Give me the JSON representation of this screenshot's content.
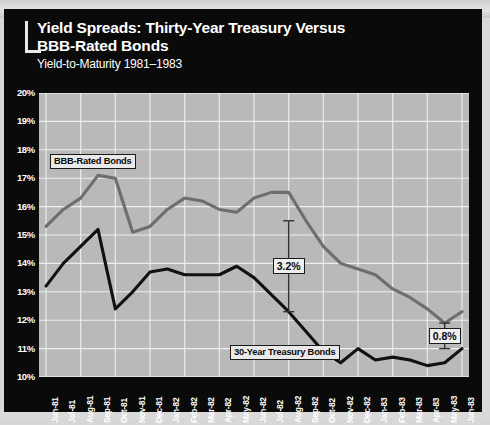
{
  "panel": {
    "background_color": "#0a0a0a",
    "plot_background_color": "#b9b9b9"
  },
  "header": {
    "title": "Yield Spreads: Thirty-Year Treasury Versus\nBBB-Rated Bonds",
    "subtitle": "Yield-to-Maturity 1981–1983"
  },
  "annotations": {
    "bbb_callout": "BBB-Rated Bonds",
    "treasury_callout": "30-Year Treasury Bonds",
    "spread_1": "3.2%",
    "spread_2": "0.8%"
  },
  "chart_data": {
    "type": "line",
    "title": "Yield Spreads: Thirty-Year Treasury Versus BBB-Rated Bonds",
    "subtitle": "Yield-to-Maturity 1981–1983",
    "xlabel": "",
    "ylabel": "",
    "ylim": [
      10,
      20
    ],
    "ytick_labels": [
      "20%",
      "19%",
      "18%",
      "17%",
      "16%",
      "15%",
      "14%",
      "13%",
      "12%",
      "11%",
      "10%"
    ],
    "ytick_values": [
      20,
      19,
      18,
      17,
      16,
      15,
      14,
      13,
      12,
      11,
      10
    ],
    "grid": true,
    "legend": "inline-callouts",
    "categories": [
      "Jun-81",
      "Jul-81",
      "Aug-81",
      "Sep-81",
      "Oct-81",
      "Nov-81",
      "Dec-81",
      "Jan-82",
      "Feb-82",
      "Mar-82",
      "Apr-82",
      "May-82",
      "Jun-82",
      "Jul-82",
      "Aug-82",
      "Sep-82",
      "Oct-82",
      "Nov-82",
      "Dec-82",
      "Jan-83",
      "Feb-83",
      "Mar-83",
      "Apr-83",
      "May-83",
      "Jun-83"
    ],
    "series": [
      {
        "name": "BBB-Rated Bonds",
        "color": "#6e6e6e",
        "values": [
          15.3,
          15.9,
          16.3,
          17.1,
          17.0,
          15.1,
          15.3,
          15.9,
          16.3,
          16.2,
          15.9,
          15.8,
          16.3,
          16.5,
          16.5,
          15.5,
          14.6,
          14.0,
          13.8,
          13.6,
          13.1,
          12.8,
          12.4,
          11.9,
          12.3
        ]
      },
      {
        "name": "30-Year Treasury Bonds",
        "color": "#111111",
        "values": [
          13.2,
          14.0,
          14.6,
          15.2,
          12.4,
          13.0,
          13.7,
          13.8,
          13.6,
          13.6,
          13.6,
          13.9,
          13.5,
          12.9,
          12.3,
          11.6,
          10.9,
          10.5,
          11.0,
          10.6,
          10.7,
          10.6,
          10.4,
          10.5,
          11.0
        ]
      }
    ],
    "markers": [
      {
        "label": "3.2%",
        "category": "Aug-82",
        "top_value": 15.5,
        "bottom_value": 12.3,
        "spread": 3.2
      },
      {
        "label": "0.8%",
        "category": "May-83",
        "top_value": 11.9,
        "bottom_value": 11.0,
        "spread": 0.8
      }
    ]
  }
}
